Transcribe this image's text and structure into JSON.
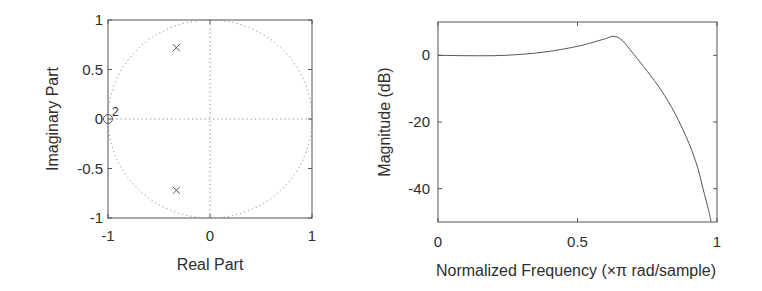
{
  "chart_data": [
    {
      "type": "scatter",
      "subtype": "pole-zero",
      "title": "",
      "xlabel": "Real Part",
      "ylabel": "Imaginary Part",
      "xlim": [
        -1,
        1
      ],
      "ylim": [
        -1,
        1
      ],
      "xticks": [
        "-1",
        "0",
        "1"
      ],
      "yticks": [
        "1",
        "0.5",
        "0",
        "-0.5",
        "-1"
      ],
      "unit_circle": true,
      "grid": "dotted axes lines at 0",
      "zeros": [
        {
          "re": -1.0,
          "im": 0.0,
          "multiplicity": 2
        }
      ],
      "poles": [
        {
          "re": -0.33,
          "im": 0.72
        },
        {
          "re": -0.33,
          "im": -0.72
        }
      ],
      "zero_multiplicity_label": "2"
    },
    {
      "type": "line",
      "title": "",
      "xlabel": "Normalized Frequency (×π rad/sample)",
      "ylabel": "Magnitude (dB)",
      "xlim": [
        0,
        1
      ],
      "ylim": [
        -50,
        10
      ],
      "xticks": [
        "0",
        "0.5",
        "1"
      ],
      "yticks": [
        "0",
        "-20",
        "-40"
      ],
      "grid": false,
      "series": [
        {
          "name": "magnitude",
          "x": [
            0,
            0.1,
            0.2,
            0.3,
            0.4,
            0.5,
            0.55,
            0.6,
            0.63,
            0.66,
            0.7,
            0.75,
            0.8,
            0.85,
            0.9,
            0.93,
            0.95,
            0.97,
            0.98
          ],
          "y": [
            0,
            -0.1,
            -0.1,
            0.3,
            1.2,
            2.7,
            3.8,
            5.0,
            5.7,
            4.5,
            0.5,
            -4.8,
            -10.5,
            -17.5,
            -26.5,
            -33.5,
            -40,
            -46.5,
            -50.5
          ]
        }
      ]
    }
  ]
}
